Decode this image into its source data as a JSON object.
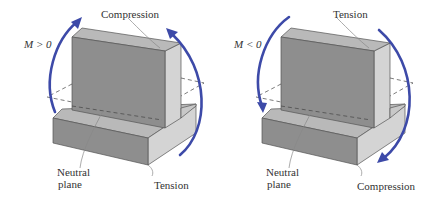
{
  "colors": {
    "arrow": "#3d4aa8",
    "front_face": "#8e8e8e",
    "top_face": "#b9b9b9",
    "side_face": "#d4d4d4",
    "edge": "#555555",
    "leader": "#888888"
  },
  "figures": [
    {
      "id": "positive-moment",
      "moment_label": "M > 0",
      "top_label": "Compression",
      "bottom_label": "Tension",
      "neutral_label_line1": "Neutral",
      "neutral_label_line2": "plane"
    },
    {
      "id": "negative-moment",
      "moment_label": "M < 0",
      "top_label": "Tension",
      "bottom_label": "Compression",
      "neutral_label_line1": "Neutral",
      "neutral_label_line2": "plane"
    }
  ]
}
